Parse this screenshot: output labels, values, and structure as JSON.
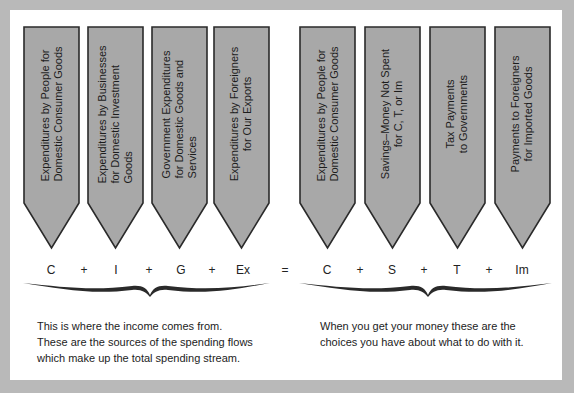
{
  "colors": {
    "background": "#b9b9b9",
    "panel": "#ffffff",
    "arrow_fill": "#a8a8a8",
    "arrow_stroke": "#2a2a2a",
    "text": "#1c1c1c"
  },
  "income_sources": {
    "arrows": [
      {
        "label": "Expenditures by People for\nDomestic Consumer Goods",
        "symbol": "C"
      },
      {
        "label": "Expenditures by Businesses\nfor Domestic Investment\nGoods",
        "symbol": "I"
      },
      {
        "label": "Government Expenditures\nfor Domestic Goods and\nServices",
        "symbol": "G"
      },
      {
        "label": "Expenditures by Foreigners\nfor Our Exports",
        "symbol": "Ex"
      }
    ],
    "caption": "This is where the income comes from.\nThese are the sources of the spending flows\nwhich make up the total spending stream."
  },
  "income_uses": {
    "arrows": [
      {
        "label": "Expenditures by People for\nDomestic Consumer Goods",
        "symbol": "C"
      },
      {
        "label": "Savings–Money Not Spent\nfor C, T, or Im",
        "symbol": "S"
      },
      {
        "label": "Tax Payments\nto Governments",
        "symbol": "T"
      },
      {
        "label": "Payments to Foreigners\nfor Imported Goods",
        "symbol": "Im"
      }
    ],
    "caption": "When you get your money these are the\nchoices you have about what to do with it."
  },
  "equation": {
    "plus": "+",
    "equals": "="
  }
}
